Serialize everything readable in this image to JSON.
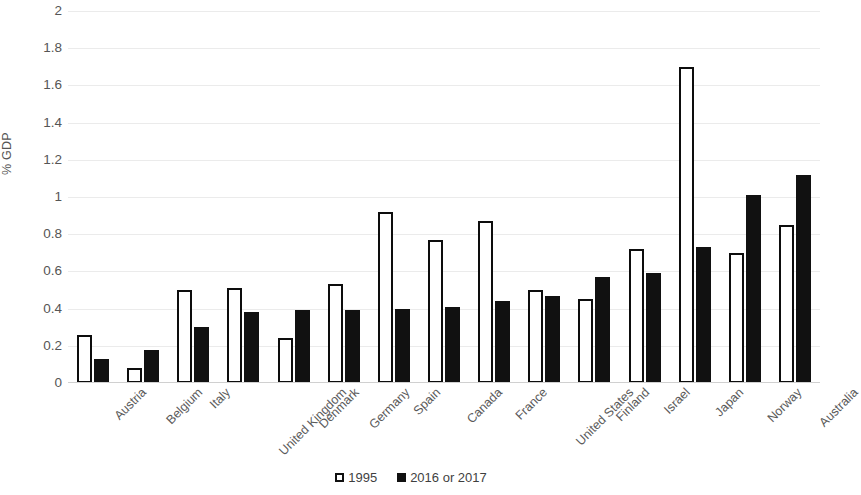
{
  "chart_data": {
    "type": "bar",
    "title": "",
    "xlabel": "",
    "ylabel": "% GDP",
    "ylim": [
      0,
      2
    ],
    "ytick_step": 0.2,
    "yticks": [
      "2",
      "1.8",
      "1.6",
      "1.4",
      "1.2",
      "1",
      "0.8",
      "0.6",
      "0.4",
      "0.2",
      "0"
    ],
    "grid": true,
    "legend_position": "bottom",
    "categories": [
      "Austria",
      "Belgium",
      "Italy",
      "United Kingdom",
      "Denmark",
      "Germany",
      "Spain",
      "Canada",
      "France",
      "United States",
      "Finland",
      "Israel",
      "Japan",
      "Norway",
      "Australia"
    ],
    "series": [
      {
        "name": "1995",
        "color": "#ffffff",
        "edge_color": "#0d0d0d",
        "values": [
          0.26,
          0.08,
          0.5,
          0.51,
          0.24,
          0.53,
          0.92,
          0.77,
          0.87,
          0.5,
          0.45,
          0.72,
          1.7,
          0.7,
          0.85
        ]
      },
      {
        "name": "2016 or 2017",
        "color": "#111111",
        "edge_color": "#111111",
        "values": [
          0.13,
          0.18,
          0.3,
          0.38,
          0.39,
          0.39,
          0.4,
          0.41,
          0.44,
          0.47,
          0.57,
          0.59,
          0.73,
          1.01,
          1.12
        ]
      }
    ]
  },
  "legend": {
    "items": [
      {
        "label": "1995",
        "swatch": "outline-square-icon"
      },
      {
        "label": "2016 or 2017",
        "swatch": "filled-square-icon"
      }
    ]
  },
  "colors": {
    "gridline": "#ebebeb",
    "axis": "#d0d0d0",
    "tick_text": "#555555",
    "series_1995": "#ffffff",
    "series_recent": "#111111"
  }
}
